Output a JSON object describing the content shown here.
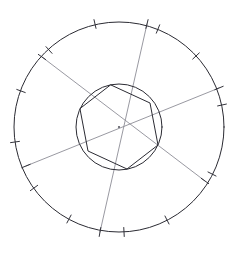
{
  "figure": {
    "kind": "geometric-construction",
    "canvas": {
      "width": 239,
      "height": 254,
      "background": "#ffffff"
    }
  },
  "colors": {
    "outline_dark": "#2b2b33",
    "chord_light": "#8d8d96",
    "tick": "#33333b",
    "center_dot": "#5a5a63",
    "background": "#ffffff"
  },
  "center": {
    "x": 119,
    "y": 127,
    "label": "center-point"
  },
  "outer_circle": {
    "name": "outer-circle",
    "cx": 119,
    "cy": 127,
    "r": 105,
    "stroke": "#2b2b33",
    "stroke_width": 1
  },
  "inner_circle": {
    "name": "inner-circle",
    "cx": 119,
    "cy": 127,
    "r": 43,
    "stroke": "#2b2b33",
    "stroke_width": 1
  },
  "hexagon": {
    "name": "inscribed-hexagon",
    "sides": 6,
    "circumradius": 43,
    "rotation_deg": -68,
    "vertices": [
      {
        "x": 111,
        "y": 85
      },
      {
        "x": 150,
        "y": 103
      },
      {
        "x": 158,
        "y": 145
      },
      {
        "x": 127,
        "y": 169
      },
      {
        "x": 88,
        "y": 151
      },
      {
        "x": 80,
        "y": 109
      }
    ]
  },
  "chords": [
    {
      "name": "chord-a",
      "from": {
        "x": 42,
        "y": 57
      },
      "to": {
        "x": 205,
        "y": 181
      },
      "stroke": "#8d8d96"
    },
    {
      "name": "chord-b",
      "from": {
        "x": 147,
        "y": 24
      },
      "to": {
        "x": 100,
        "y": 232
      },
      "stroke": "#8d8d96"
    },
    {
      "name": "chord-c",
      "from": {
        "x": 219,
        "y": 88
      },
      "to": {
        "x": 26,
        "y": 166
      },
      "stroke": "#8d8d96"
    }
  ],
  "outer_ticks": [
    {
      "name": "tick-1",
      "angle_deg": -103,
      "x": 95,
      "y": 24
    },
    {
      "name": "tick-2",
      "angle_deg": -68,
      "x": 158,
      "y": 29
    },
    {
      "name": "tick-3",
      "angle_deg": -43,
      "x": 196,
      "y": 56
    },
    {
      "name": "tick-4",
      "angle_deg": -12,
      "x": 222,
      "y": 105
    },
    {
      "name": "tick-5",
      "angle_deg": 27,
      "x": 212,
      "y": 174
    },
    {
      "name": "tick-6",
      "angle_deg": 63,
      "x": 167,
      "y": 220
    },
    {
      "name": "tick-7",
      "angle_deg": 87,
      "x": 124,
      "y": 232
    },
    {
      "name": "tick-8",
      "angle_deg": 118,
      "x": 69,
      "y": 219
    },
    {
      "name": "tick-9",
      "angle_deg": 144,
      "x": 34,
      "y": 188
    },
    {
      "name": "tick-10",
      "angle_deg": 172,
      "x": 15,
      "y": 142
    },
    {
      "name": "tick-11",
      "angle_deg": 200,
      "x": 21,
      "y": 91
    },
    {
      "name": "tick-12",
      "angle_deg": 228,
      "x": 49,
      "y": 50
    }
  ],
  "chord_endpoint_ticks": [
    {
      "name": "endpoint-tick-a1",
      "x": 42,
      "y": 57,
      "angle_deg": 215
    },
    {
      "name": "endpoint-tick-a2",
      "x": 205,
      "y": 181,
      "angle_deg": 35
    },
    {
      "name": "endpoint-tick-b1",
      "x": 147,
      "y": 24,
      "angle_deg": -76
    },
    {
      "name": "endpoint-tick-b2",
      "x": 100,
      "y": 232,
      "angle_deg": 100
    },
    {
      "name": "endpoint-tick-c1",
      "x": 219,
      "y": 88,
      "angle_deg": -22
    },
    {
      "name": "endpoint-tick-c2",
      "x": 26,
      "y": 166,
      "angle_deg": 158
    }
  ]
}
